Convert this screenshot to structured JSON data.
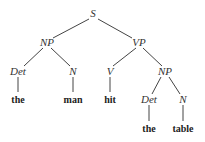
{
  "tree": {
    "nodes": {
      "S": {
        "label": "S"
      },
      "NP1": {
        "label": "NP"
      },
      "VP": {
        "label": "VP"
      },
      "Det1": {
        "label": "Det"
      },
      "N1": {
        "label": "N"
      },
      "V": {
        "label": "V"
      },
      "NP2": {
        "label": "NP"
      },
      "Det2": {
        "label": "Det"
      },
      "N2": {
        "label": "N"
      }
    },
    "words": {
      "w1": "the",
      "w2": "man",
      "w3": "hit",
      "w4": "the",
      "w5": "table"
    }
  }
}
